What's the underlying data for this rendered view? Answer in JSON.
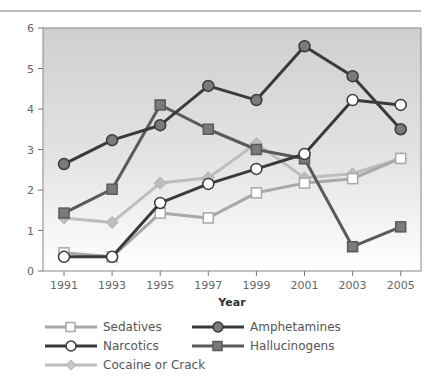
{
  "chart_data": {
    "type": "line",
    "title": "",
    "xlabel": "Year",
    "ylabel": "",
    "x": [
      1991,
      1993,
      1995,
      1997,
      1999,
      2001,
      2003,
      2005
    ],
    "x_tick_labels": [
      "1991",
      "1993",
      "1995",
      "1997",
      "1999",
      "2001",
      "2003",
      "2005"
    ],
    "y_ticks": [
      0,
      1,
      2,
      3,
      4,
      5,
      6
    ],
    "ylim": [
      0,
      6
    ],
    "grid": false,
    "background": "vertical gradient gray-to-white",
    "legend_position": "bottom",
    "series": [
      {
        "name": "Sedatives",
        "marker": "square",
        "marker_fill": "#ffffff",
        "line_color": "#a8a8a8",
        "values": [
          0.45,
          0.35,
          1.43,
          1.31,
          1.93,
          2.17,
          2.28,
          2.78
        ]
      },
      {
        "name": "Narcotics",
        "marker": "circle",
        "marker_fill": "#ffffff",
        "line_color": "#3a3a3a",
        "values": [
          0.35,
          0.35,
          1.68,
          2.15,
          2.52,
          2.89,
          4.22,
          4.1
        ]
      },
      {
        "name": "Cocaine or Crack",
        "marker": "diamond",
        "marker_fill": "#bdbdbd",
        "line_color": "#bdbdbd",
        "values": [
          1.31,
          1.2,
          2.17,
          2.3,
          3.15,
          2.3,
          2.4,
          2.78
        ]
      },
      {
        "name": "Amphetamines",
        "marker": "circle",
        "marker_fill": "#7a7a7a",
        "line_color": "#3a3a3a",
        "values": [
          2.64,
          3.23,
          3.6,
          4.57,
          4.22,
          5.55,
          4.81,
          3.5
        ]
      },
      {
        "name": "Hallucinogens",
        "marker": "square",
        "marker_fill": "#7a7a7a",
        "line_color": "#5a5a5a",
        "values": [
          1.43,
          2.02,
          4.1,
          3.5,
          3.0,
          2.77,
          0.6,
          1.09
        ]
      }
    ]
  },
  "legend": {
    "items": [
      {
        "label": "Sedatives"
      },
      {
        "label": "Amphetamines"
      },
      {
        "label": "Narcotics"
      },
      {
        "label": "Hallucinogens"
      },
      {
        "label": "Cocaine or Crack"
      }
    ]
  }
}
